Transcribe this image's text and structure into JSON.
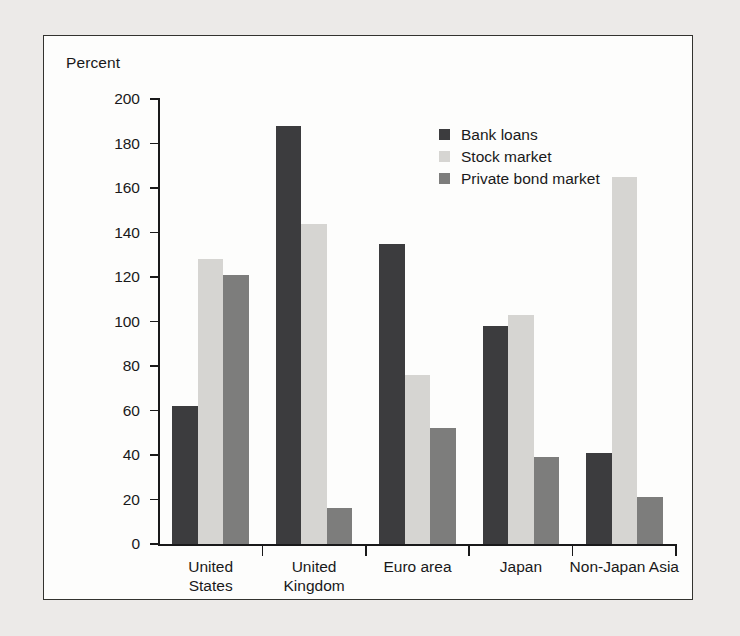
{
  "chart_data": {
    "type": "bar",
    "title": "",
    "xlabel": "",
    "ylabel": "Percent",
    "ylim": [
      0,
      200
    ],
    "ytick_step": 20,
    "yticks": [
      0,
      20,
      40,
      60,
      80,
      100,
      120,
      140,
      160,
      180,
      200
    ],
    "ytick_labels": [
      "0",
      "20",
      "40",
      "60",
      "80",
      "100",
      "120",
      "140",
      "160",
      "180",
      "200"
    ],
    "grid": false,
    "legend_position": "inside-upper-right",
    "categories": [
      "United\nStates",
      "United\nKingdom",
      "Euro area",
      "Japan",
      "Non-Japan Asia"
    ],
    "category_labels_flat": [
      "United States",
      "United Kingdom",
      "Euro area",
      "Japan",
      "Non-Japan Asia"
    ],
    "series": [
      {
        "name": "Bank loans",
        "color": "#3c3c3e",
        "values": [
          62,
          188,
          135,
          98,
          41
        ]
      },
      {
        "name": "Stock market",
        "color": "#d6d5d2",
        "values": [
          128,
          144,
          76,
          103,
          165
        ]
      },
      {
        "name": "Private bond market",
        "color": "#7d7d7c",
        "values": [
          121,
          16,
          52,
          39,
          21
        ]
      }
    ]
  },
  "panel": {
    "background_color": "#fdfdfc",
    "border_color": "#33332f",
    "page_background_color": "#eceae8"
  }
}
